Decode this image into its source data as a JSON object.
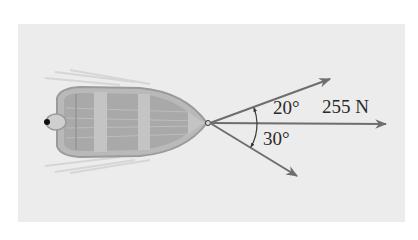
{
  "figure": {
    "labels": {
      "force": "255 N",
      "angle_upper": "20°",
      "angle_lower": "30°"
    },
    "colors": {
      "background": "#ececec",
      "arrow": "#6e6e6e",
      "boat_hull": "#b9b9b9",
      "boat_deck": "#a9a9a9",
      "text": "#2a2a2a"
    },
    "vectors": [
      {
        "name": "upper",
        "angle_deg": 20,
        "direction": "above horizontal"
      },
      {
        "name": "middle",
        "angle_deg": 0,
        "magnitude": "255 N"
      },
      {
        "name": "lower",
        "angle_deg": -30,
        "direction": "below horizontal"
      }
    ]
  }
}
